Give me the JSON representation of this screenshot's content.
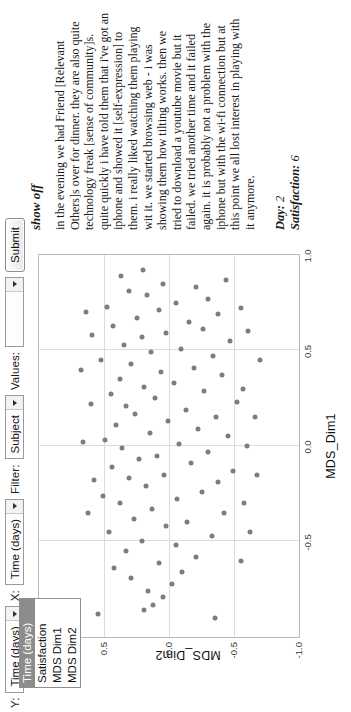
{
  "toolbar": {
    "y_label": "Y:",
    "y_value": "Time (days)",
    "x_label": "X:",
    "x_value": "Time (days)",
    "filter_label": "Filter:",
    "filter_value": "Subject",
    "values_label": "Values:",
    "values_value": "",
    "submit_label": "Submit",
    "arrow_icon": "chevron-down-icon"
  },
  "dropdown": {
    "options": [
      {
        "label": "Time (days)",
        "selected": true
      },
      {
        "label": "Satisfaction",
        "selected": false
      },
      {
        "label": "MDS Dim1",
        "selected": false
      },
      {
        "label": "MDS Dim2",
        "selected": false
      }
    ]
  },
  "chart_data": {
    "type": "scatter",
    "title": "",
    "xlabel": "MDS_Dim1",
    "ylabel": "MDS_Dim2",
    "xlim": [
      -1.0,
      1.0
    ],
    "ylim": [
      -1.0,
      1.0
    ],
    "xticks": [
      -0.5,
      0.0,
      0.5,
      1.0
    ],
    "xtick_labels": [
      "-0.5",
      "0.0",
      "0.5",
      "1.0"
    ],
    "yticks": [
      -1.0,
      -0.5,
      0.0,
      0.5
    ],
    "ytick_labels": [
      "-1.0",
      "-0.5",
      "0.0",
      "0.5"
    ],
    "grid": true,
    "legend": "none",
    "point_color": "#7d7d7d",
    "points": [
      [
        -0.86,
        0.19
      ],
      [
        -0.83,
        0.12
      ],
      [
        -0.79,
        0.05
      ],
      [
        -0.76,
        0.16
      ],
      [
        -0.72,
        -0.02
      ],
      [
        -0.69,
        0.29
      ],
      [
        -0.66,
        -0.1
      ],
      [
        -0.64,
        0.42
      ],
      [
        -0.61,
        0.08
      ],
      [
        -0.58,
        -0.21
      ],
      [
        -0.55,
        0.33
      ],
      [
        -0.52,
        -0.05
      ],
      [
        -0.5,
        0.21
      ],
      [
        -0.47,
        -0.33
      ],
      [
        -0.45,
        0.46
      ],
      [
        -0.42,
        0.02
      ],
      [
        -0.4,
        -0.14
      ],
      [
        -0.38,
        0.27
      ],
      [
        -0.35,
        -0.42
      ],
      [
        -0.33,
        0.13
      ],
      [
        -0.3,
        0.38
      ],
      [
        -0.28,
        -0.06
      ],
      [
        -0.26,
        0.51
      ],
      [
        -0.24,
        -0.25
      ],
      [
        -0.21,
        0.18
      ],
      [
        -0.19,
        -0.38
      ],
      [
        -0.17,
        0.31
      ],
      [
        -0.15,
        0.04
      ],
      [
        -0.13,
        -0.49
      ],
      [
        -0.11,
        0.44
      ],
      [
        -0.09,
        -0.17
      ],
      [
        -0.07,
        0.23
      ],
      [
        -0.05,
        0.09
      ],
      [
        -0.03,
        -0.3
      ],
      [
        -0.01,
        0.36
      ],
      [
        0.01,
        -0.08
      ],
      [
        0.03,
        0.49
      ],
      [
        0.05,
        -0.45
      ],
      [
        0.07,
        0.15
      ],
      [
        0.09,
        -0.22
      ],
      [
        0.11,
        0.41
      ],
      [
        0.13,
        0.01
      ],
      [
        0.15,
        -0.36
      ],
      [
        0.17,
        0.26
      ],
      [
        0.19,
        -0.13
      ],
      [
        0.21,
        0.33
      ],
      [
        0.23,
        -0.52
      ],
      [
        0.25,
        0.11
      ],
      [
        0.27,
        0.45
      ],
      [
        0.29,
        -0.27
      ],
      [
        0.31,
        0.19
      ],
      [
        0.33,
        -0.04
      ],
      [
        0.35,
        0.38
      ],
      [
        0.37,
        -0.41
      ],
      [
        0.39,
        0.06
      ],
      [
        0.41,
        -0.19
      ],
      [
        0.43,
        0.29
      ],
      [
        0.45,
        0.52
      ],
      [
        0.47,
        -0.34
      ],
      [
        0.49,
        0.14
      ],
      [
        0.51,
        -0.09
      ],
      [
        0.53,
        0.35
      ],
      [
        0.55,
        -0.47
      ],
      [
        0.57,
        0.21
      ],
      [
        0.59,
        0.02
      ],
      [
        0.61,
        -0.26
      ],
      [
        0.63,
        0.43
      ],
      [
        0.65,
        -0.15
      ],
      [
        0.67,
        0.25
      ],
      [
        0.69,
        -0.38
      ],
      [
        0.71,
        0.08
      ],
      [
        0.73,
        0.48
      ],
      [
        0.75,
        -0.05
      ],
      [
        0.77,
        -0.3
      ],
      [
        0.79,
        0.17
      ],
      [
        0.81,
        0.31
      ],
      [
        0.83,
        -0.21
      ],
      [
        0.85,
        0.05
      ],
      [
        0.87,
        -0.44
      ],
      [
        0.89,
        0.37
      ],
      [
        -0.6,
        -0.55
      ],
      [
        -0.45,
        -0.62
      ],
      [
        -0.3,
        -0.58
      ],
      [
        -0.15,
        -0.68
      ],
      [
        0.0,
        -0.6
      ],
      [
        0.15,
        -0.66
      ],
      [
        0.3,
        -0.57
      ],
      [
        0.45,
        -0.7
      ],
      [
        0.6,
        -0.61
      ],
      [
        0.72,
        -0.55
      ],
      [
        -0.35,
        0.62
      ],
      [
        -0.18,
        0.58
      ],
      [
        0.02,
        0.66
      ],
      [
        0.22,
        0.6
      ],
      [
        0.4,
        0.68
      ],
      [
        0.58,
        0.59
      ],
      [
        0.7,
        0.64
      ],
      [
        -0.9,
        -0.35
      ],
      [
        -0.88,
        0.55
      ],
      [
        0.92,
        0.2
      ]
    ]
  },
  "entry": {
    "title": "show off",
    "body": "in the evening we had Friend [Relevant Others]s over for dinner. they are also quite technology freak [sense of community]s. quite quickly i have told them that i've got an iphone and showed it [self-expression] to them. i really liked watching them playing wit it. we started browsing web - i was showing them how tilting works. then we tried to download a youtube movie but it failed. we tried another time and it failed again. it is probably not a problem with the iphone but with the wi-fi connection but at this point we all lost interest in playing with it anymore.",
    "day_label": "Day:",
    "day_value": "2",
    "satisfaction_label": "Satisfaction:",
    "satisfaction_value": "6"
  }
}
